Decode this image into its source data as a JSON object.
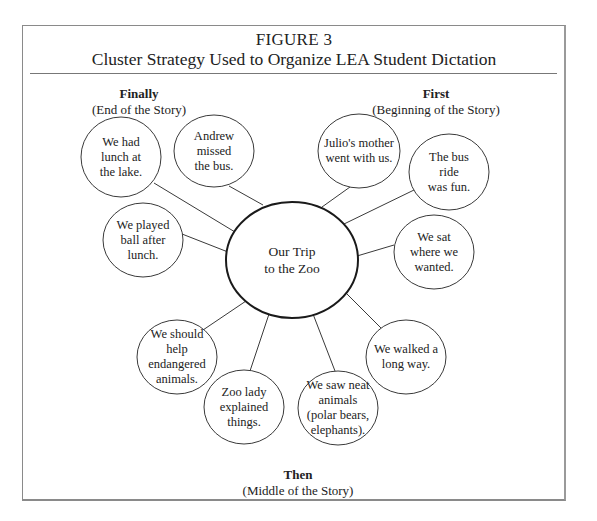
{
  "figure": {
    "label": "FIGURE 3",
    "title": "Cluster Strategy Used to Organize LEA Student Dictation"
  },
  "sections": {
    "finally": {
      "heading": "Finally",
      "subheading": "(End of the Story)"
    },
    "first": {
      "heading": "First",
      "subheading": "(Beginning of the Story)"
    },
    "then": {
      "heading": "Then",
      "subheading": "(Middle of the Story)"
    }
  },
  "center_node": {
    "text": "Our Trip\nto the Zoo",
    "cx": 292,
    "cy": 260,
    "rx": 66,
    "ry": 58
  },
  "nodes": [
    {
      "id": "lunch",
      "text": "We had\nlunch at\nthe lake.",
      "section": "finally",
      "cx": 121,
      "cy": 157,
      "rx": 40,
      "ry": 40,
      "line": [
        154,
        183,
        235,
        232
      ]
    },
    {
      "id": "andrew",
      "text": "Andrew\nmissed\nthe bus.",
      "section": "finally",
      "cx": 214,
      "cy": 151,
      "rx": 40,
      "ry": 36,
      "line": [
        229,
        186,
        263,
        205
      ]
    },
    {
      "id": "ball",
      "text": "We played\nball after\nlunch.",
      "section": "finally",
      "cx": 143,
      "cy": 240,
      "rx": 40,
      "ry": 37,
      "line": [
        182,
        234,
        228,
        252
      ]
    },
    {
      "id": "julio",
      "text": "Julio's mother\nwent with us.",
      "section": "first",
      "cx": 359,
      "cy": 151,
      "rx": 41,
      "ry": 37,
      "line": [
        350,
        187,
        322,
        207
      ]
    },
    {
      "id": "busride",
      "text": "The bus\nride\nwas fun.",
      "section": "first",
      "cx": 449,
      "cy": 172,
      "rx": 40,
      "ry": 38,
      "line": [
        414,
        190,
        344,
        224
      ]
    },
    {
      "id": "sat",
      "text": "We sat\nwhere we\nwanted.",
      "section": "first",
      "cx": 434,
      "cy": 252,
      "rx": 40,
      "ry": 37,
      "line": [
        394,
        245,
        357,
        256
      ]
    },
    {
      "id": "walked",
      "text": "We walked a\nlong way.",
      "section": "then",
      "cx": 406,
      "cy": 357,
      "rx": 40,
      "ry": 37,
      "line": [
        381,
        328,
        346,
        293
      ]
    },
    {
      "id": "neat",
      "text": "We saw neat\nanimals\n(polar bears,\nelephants).",
      "section": "then",
      "cx": 338,
      "cy": 408,
      "rx": 40,
      "ry": 37,
      "line": [
        335,
        371,
        313,
        314
      ]
    },
    {
      "id": "zoolady",
      "text": "Zoo lady\nexplained\nthings.",
      "section": "then",
      "cx": 244,
      "cy": 407,
      "rx": 40,
      "ry": 37,
      "line": [
        250,
        371,
        269,
        314
      ]
    },
    {
      "id": "endangered",
      "text": "We should\nhelp\nendangered\nanimals.",
      "section": "then",
      "cx": 177,
      "cy": 357,
      "rx": 40,
      "ry": 37,
      "line": [
        203,
        330,
        246,
        301
      ]
    }
  ],
  "colors": {
    "stroke": "#3a3a3a",
    "center_stroke": "#1a1a1a",
    "frame": "#8a8a8a",
    "text": "#222222"
  }
}
